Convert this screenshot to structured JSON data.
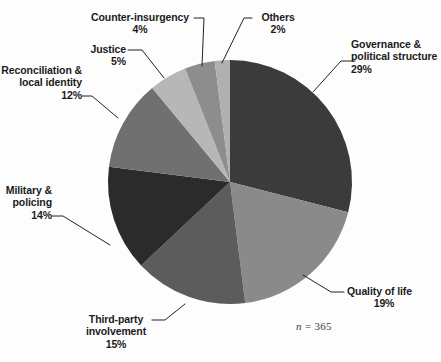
{
  "figure": {
    "background_color": "#fdfdfd",
    "sample_size_prefix": "n",
    "sample_size_equals": "=",
    "sample_size_value": "365",
    "sample_size_text": "n = 365"
  },
  "chart_data": {
    "type": "pie",
    "title": "",
    "xlabel": "",
    "ylabel": "",
    "legend_position": "none",
    "grid": false,
    "units": "percent",
    "start_angle_deg": 0,
    "direction": "clockwise",
    "total_n": 365,
    "categories": [
      "Governance & political structure",
      "Quality of life",
      "Third-party involvement",
      "Military & policing",
      "Reconciliation & local identity",
      "Justice",
      "Counter-insurgency",
      "Others"
    ],
    "values": [
      29,
      19,
      15,
      14,
      12,
      5,
      4,
      2
    ],
    "colors": [
      "#3b3b3b",
      "#8a8a8a",
      "#5c5c5c",
      "#2b2b2b",
      "#707070",
      "#b7b7b7",
      "#8d8d8d",
      "#b0b0b0"
    ],
    "slices": [
      {
        "label": "Governance &\npolitical structure",
        "label_line1": "Governance &",
        "label_line2": "political structure",
        "value": 29,
        "value_label": "29%",
        "color": "#3b3b3b"
      },
      {
        "label": "Quality of life",
        "label_line1": "Quality of life",
        "label_line2": "",
        "value": 19,
        "value_label": "19%",
        "color": "#8a8a8a"
      },
      {
        "label": "Third-party\ninvolvement",
        "label_line1": "Third-party",
        "label_line2": "involvement",
        "value": 15,
        "value_label": "15%",
        "color": "#5c5c5c"
      },
      {
        "label": "Military &\npolicing",
        "label_line1": "Military &",
        "label_line2": "policing",
        "value": 14,
        "value_label": "14%",
        "color": "#2b2b2b"
      },
      {
        "label": "Reconciliation &\nlocal identity",
        "label_line1": "Reconciliation &",
        "label_line2": "local identity",
        "value": 12,
        "value_label": "12%",
        "color": "#707070"
      },
      {
        "label": "Justice",
        "label_line1": "Justice",
        "label_line2": "",
        "value": 5,
        "value_label": "5%",
        "color": "#b7b7b7"
      },
      {
        "label": "Counter-insurgency",
        "label_line1": "Counter-insurgency",
        "label_line2": "",
        "value": 4,
        "value_label": "4%",
        "color": "#8d8d8d"
      },
      {
        "label": "Others",
        "label_line1": "Others",
        "label_line2": "",
        "value": 2,
        "value_label": "2%",
        "color": "#b0b0b0"
      }
    ]
  }
}
